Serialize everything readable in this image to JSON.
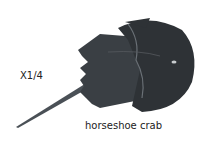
{
  "scale_label": "X1/4",
  "caption": "horseshoe crab",
  "colors": {
    "body": "#2e3236",
    "highlight": "#4a5056",
    "background": "#ffffff"
  }
}
